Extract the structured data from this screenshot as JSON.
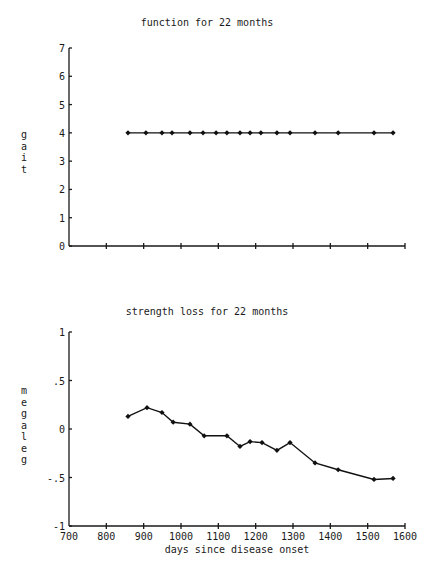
{
  "chart_data": [
    {
      "type": "line",
      "title": "function for 22 months",
      "xlabel": "",
      "ylabel": "gait",
      "xlim": [
        700,
        1600
      ],
      "ylim": [
        0,
        7
      ],
      "x_ticks": [
        700,
        800,
        900,
        1000,
        1100,
        1200,
        1300,
        1400,
        1500,
        1600
      ],
      "x_tick_labels_shown": false,
      "y_ticks": [
        0,
        1,
        2,
        3,
        4,
        5,
        6,
        7
      ],
      "y_tick_labels": [
        "0",
        "1",
        "2",
        "3",
        "4",
        "5",
        "6",
        "7"
      ],
      "grid": false,
      "legend": null,
      "marker": "diamond",
      "x": [
        858,
        906,
        949,
        976,
        1024,
        1059,
        1094,
        1123,
        1158,
        1185,
        1214,
        1257,
        1292,
        1359,
        1421,
        1517,
        1568
      ],
      "y": [
        4,
        4,
        4,
        4,
        4,
        4,
        4,
        4,
        4,
        4,
        4,
        4,
        4,
        4,
        4,
        4,
        4
      ]
    },
    {
      "type": "line",
      "title": "strength loss for 22 months",
      "xlabel": "days since disease onset",
      "ylabel": "megaleg",
      "xlim": [
        700,
        1600
      ],
      "ylim": [
        -1,
        1
      ],
      "x_ticks": [
        700,
        800,
        900,
        1000,
        1100,
        1200,
        1300,
        1400,
        1500,
        1600
      ],
      "x_tick_labels": [
        "700",
        "800",
        "900",
        "1000",
        "1100",
        "1200",
        "1300",
        "1400",
        "1500",
        "1600"
      ],
      "y_ticks": [
        -1,
        -0.5,
        0,
        0.5,
        1
      ],
      "y_tick_labels": [
        "-1",
        "-.5",
        "0",
        ".5",
        "1"
      ],
      "grid": false,
      "legend": null,
      "marker": "diamond",
      "x": [
        858,
        909,
        949,
        979,
        1024,
        1062,
        1123,
        1158,
        1185,
        1217,
        1257,
        1292,
        1359,
        1421,
        1517,
        1568
      ],
      "y": [
        0.13,
        0.22,
        0.17,
        0.07,
        0.05,
        -0.07,
        -0.07,
        -0.18,
        -0.13,
        -0.14,
        -0.22,
        -0.14,
        -0.35,
        -0.42,
        -0.52,
        -0.51
      ]
    }
  ],
  "figure": {
    "top_title": "function for 22 months",
    "bottom_title": "strength loss for 22 months",
    "top_ylabel": "gait",
    "bottom_ylabel": "megaleg",
    "xlabel": "days since disease onset"
  }
}
